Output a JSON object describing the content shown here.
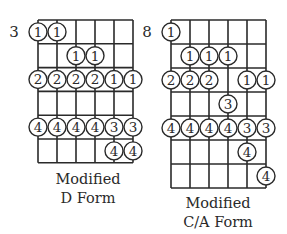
{
  "diagrams": [
    {
      "id": "d-form",
      "start_fret": "3",
      "caption_line1": "Modified",
      "caption_line2": "D Form",
      "strings": 6,
      "rows": 6,
      "notes": [
        {
          "row": 0,
          "string": 0,
          "finger": "1"
        },
        {
          "row": 0,
          "string": 1,
          "finger": "1"
        },
        {
          "row": 1,
          "string": 2,
          "finger": "1"
        },
        {
          "row": 1,
          "string": 3,
          "finger": "1"
        },
        {
          "row": 2,
          "string": 0,
          "finger": "2"
        },
        {
          "row": 2,
          "string": 1,
          "finger": "2"
        },
        {
          "row": 2,
          "string": 2,
          "finger": "2"
        },
        {
          "row": 2,
          "string": 3,
          "finger": "2"
        },
        {
          "row": 2,
          "string": 4,
          "finger": "1"
        },
        {
          "row": 2,
          "string": 5,
          "finger": "1"
        },
        {
          "row": 4,
          "string": 0,
          "finger": "4"
        },
        {
          "row": 4,
          "string": 1,
          "finger": "4"
        },
        {
          "row": 4,
          "string": 2,
          "finger": "4"
        },
        {
          "row": 4,
          "string": 3,
          "finger": "4"
        },
        {
          "row": 4,
          "string": 4,
          "finger": "3"
        },
        {
          "row": 4,
          "string": 5,
          "finger": "3"
        },
        {
          "row": 5,
          "string": 4,
          "finger": "4"
        },
        {
          "row": 5,
          "string": 5,
          "finger": "4"
        }
      ]
    },
    {
      "id": "ca-form",
      "start_fret": "8",
      "caption_line1": "Modified",
      "caption_line2": "C/A Form",
      "strings": 6,
      "rows": 7,
      "notes": [
        {
          "row": 0,
          "string": 0,
          "finger": "1"
        },
        {
          "row": 1,
          "string": 1,
          "finger": "1"
        },
        {
          "row": 1,
          "string": 2,
          "finger": "1"
        },
        {
          "row": 1,
          "string": 3,
          "finger": "1"
        },
        {
          "row": 2,
          "string": 0,
          "finger": "2"
        },
        {
          "row": 2,
          "string": 1,
          "finger": "2"
        },
        {
          "row": 2,
          "string": 2,
          "finger": "2"
        },
        {
          "row": 2,
          "string": 4,
          "finger": "1"
        },
        {
          "row": 2,
          "string": 5,
          "finger": "1"
        },
        {
          "row": 3,
          "string": 3,
          "finger": "3"
        },
        {
          "row": 4,
          "string": 0,
          "finger": "4"
        },
        {
          "row": 4,
          "string": 1,
          "finger": "4"
        },
        {
          "row": 4,
          "string": 2,
          "finger": "4"
        },
        {
          "row": 4,
          "string": 3,
          "finger": "4"
        },
        {
          "row": 4,
          "string": 4,
          "finger": "3"
        },
        {
          "row": 4,
          "string": 5,
          "finger": "3"
        },
        {
          "row": 5,
          "string": 4,
          "finger": "4"
        },
        {
          "row": 6,
          "string": 5,
          "finger": "4"
        }
      ]
    }
  ],
  "colors": {
    "ink": "#2a2a2a",
    "background": "#ffffff"
  }
}
